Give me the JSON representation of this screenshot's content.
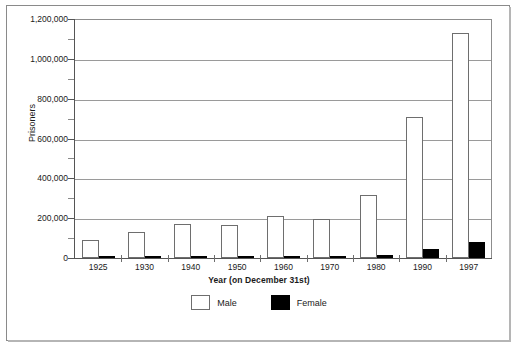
{
  "chart_data": {
    "type": "bar",
    "title": "",
    "xlabel": "Year  (on December 31st)",
    "ylabel": "Prisoners",
    "categories": [
      "1925",
      "1930",
      "1940",
      "1950",
      "1960",
      "1970",
      "1980",
      "1990",
      "1997"
    ],
    "series": [
      {
        "name": "Male",
        "color": "#ffffff",
        "values": [
          92000,
          129000,
          173000,
          166000,
          213000,
          196000,
          315000,
          710000,
          1130000
        ]
      },
      {
        "name": "Female",
        "color": "#000000",
        "values": [
          4000,
          5000,
          7000,
          6000,
          8000,
          6000,
          13000,
          44000,
          80000
        ]
      }
    ],
    "ylim": [
      0,
      1200000
    ],
    "y_major_ticks": [
      0,
      200000,
      400000,
      600000,
      800000,
      1000000,
      1200000
    ],
    "y_tick_labels": [
      "0",
      "200,000",
      "400,000",
      "600,000",
      "800,000",
      "1,000,000",
      "1,200,000"
    ],
    "y_minor_ticks": [
      100000,
      300000,
      500000,
      700000,
      900000,
      1100000
    ],
    "grid": "horizontal",
    "legend_position": "bottom-center"
  },
  "legend": {
    "items": [
      {
        "label": "Male"
      },
      {
        "label": "Female"
      }
    ]
  }
}
